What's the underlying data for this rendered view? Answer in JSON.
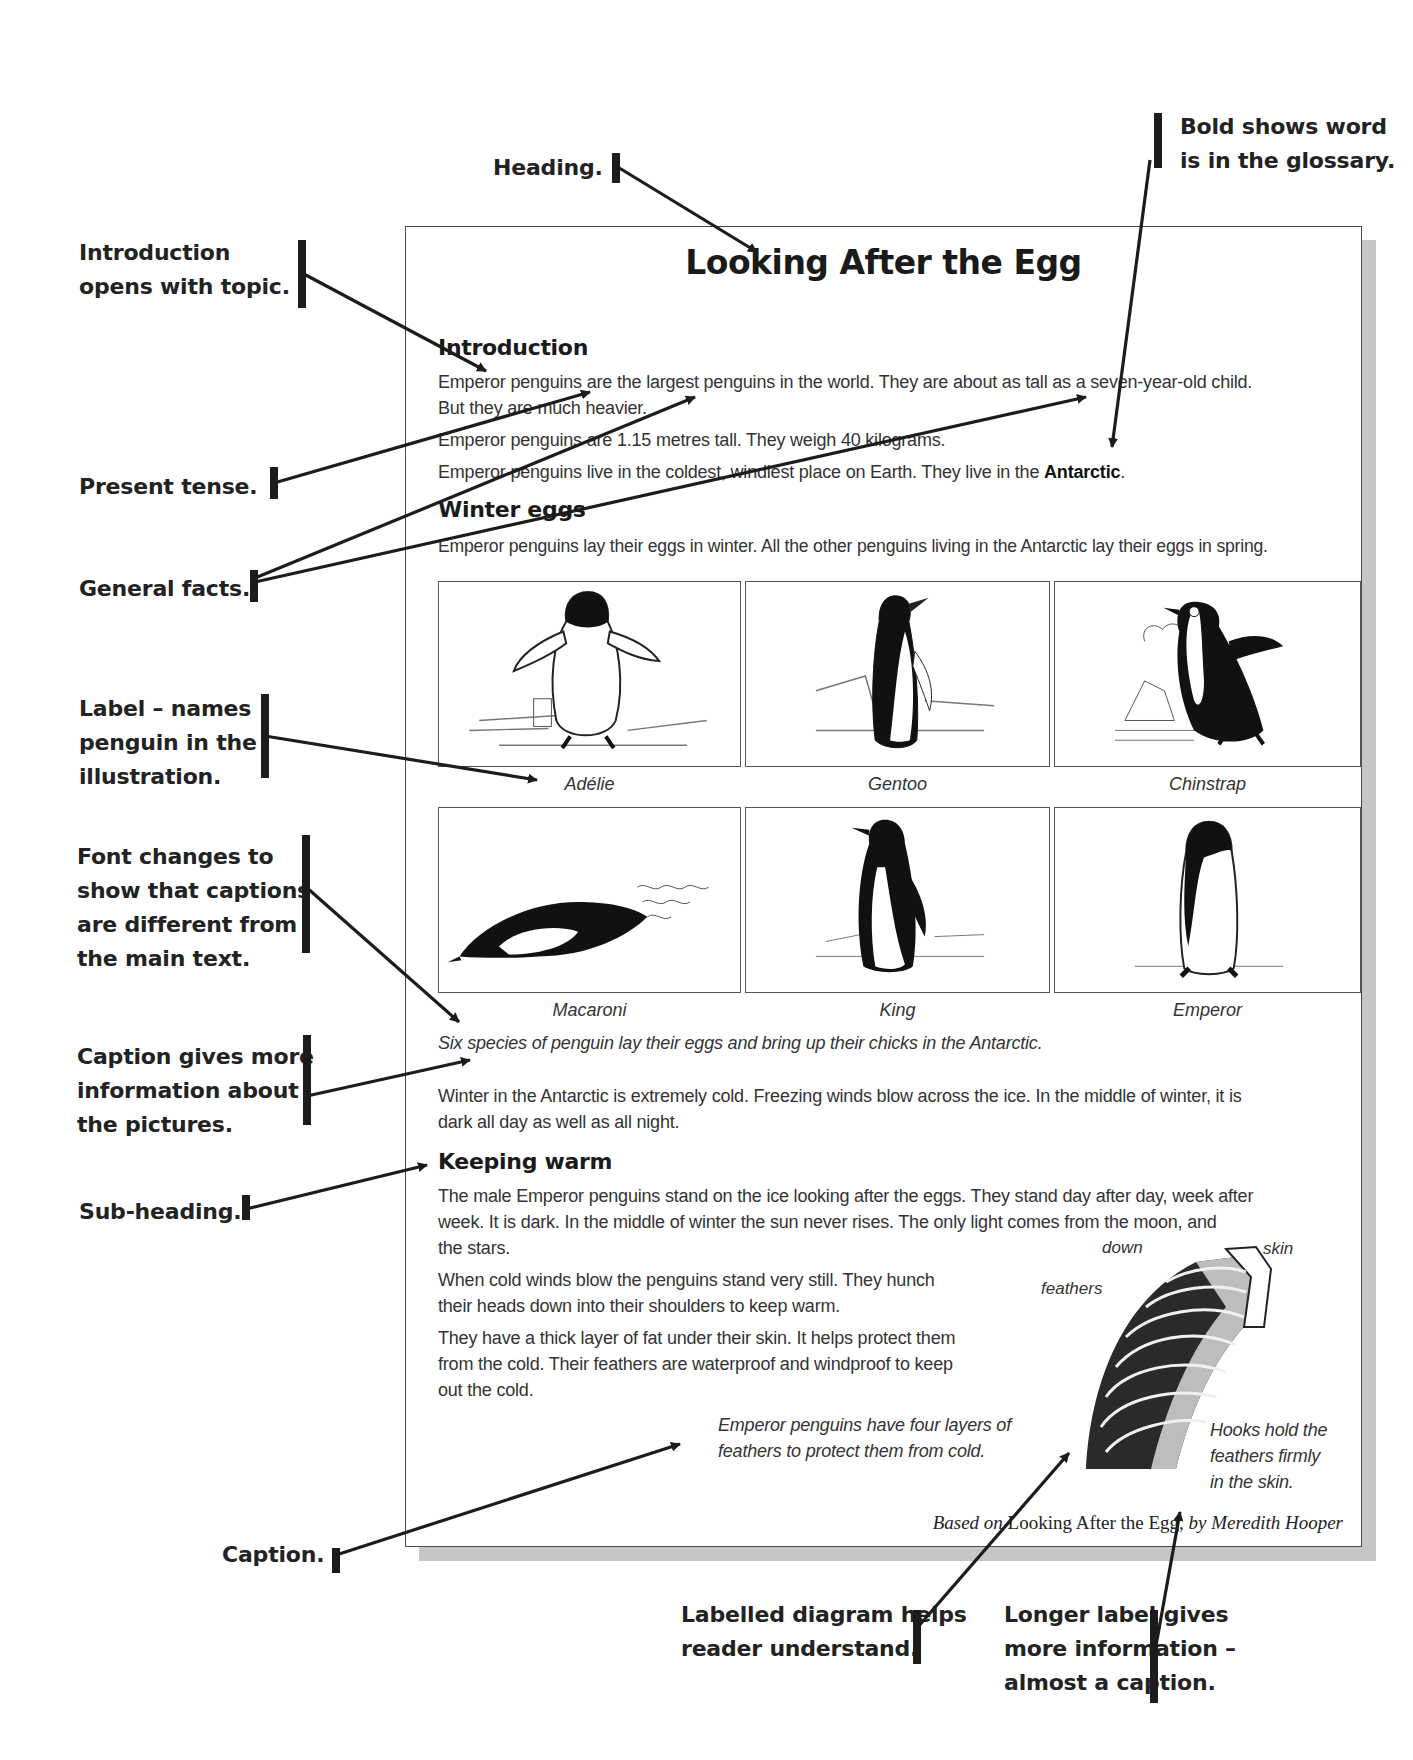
{
  "document": {
    "title": "Looking After the Egg",
    "sections": [
      {
        "heading": "Introduction",
        "paragraphs": [
          "Emperor penguins are the largest penguins in the world. They are about as tall as a seven-year-old child.",
          "But they are much heavier.",
          "Emperor penguins are 1.15 metres tall. They weigh 40 kilograms.",
          "Emperor penguins live in the coldest, windiest place on Earth. They live in the",
          "Antarctic",
          "."
        ]
      },
      {
        "heading": "Winter eggs",
        "paragraphs": [
          "Emperor penguins lay their eggs in winter. All the other penguins living in the Antarctic lay their eggs in spring."
        ]
      }
    ],
    "penguin_images": [
      {
        "label": "Adélie",
        "icon": "adelie-penguin-illustration"
      },
      {
        "label": "Gentoo",
        "icon": "gentoo-penguin-illustration"
      },
      {
        "label": "Chinstrap",
        "icon": "chinstrap-penguin-illustration"
      },
      {
        "label": "Macaroni",
        "icon": "macaroni-penguin-illustration"
      },
      {
        "label": "King",
        "icon": "king-penguin-illustration"
      },
      {
        "label": "Emperor",
        "icon": "emperor-penguin-illustration"
      }
    ],
    "figure_caption": "Six species of penguin lay their eggs and bring up their chicks in the Antarctic.",
    "winter_paragraph": [
      "Winter in the Antarctic is extremely cold. Freezing winds blow across the ice. In the middle of winter, it is",
      "dark all day as well as all night."
    ],
    "keeping_warm": {
      "heading": "Keeping warm",
      "paragraph1": [
        "The male Emperor penguins stand on the ice looking after the eggs. They stand day after day, week after",
        "week. It is dark. In the middle of winter the sun never rises. The only light comes from the moon, and",
        "the stars."
      ],
      "paragraph2": [
        "When cold winds blow the penguins stand very still. They hunch",
        "their heads down into their shoulders to keep warm."
      ],
      "paragraph3": [
        "They have a thick layer of fat under their skin. It helps protect them",
        "from the cold. Their feathers are waterproof and windproof to keep",
        "out the cold."
      ]
    },
    "diagram": {
      "caption": [
        "Emperor penguins have four layers of",
        "feathers to protect them from cold."
      ],
      "labels": {
        "down": "down",
        "skin": "skin",
        "feathers": "feathers",
        "hooks": [
          "Hooks hold the",
          "feathers firmly",
          "in the skin."
        ]
      }
    },
    "attribution": {
      "prefix": "Based on",
      "book": "Looking After the Egg,",
      "by": "by Meredith Hooper"
    }
  },
  "annotations": {
    "heading": "Heading.",
    "bold_glossary": [
      "Bold shows word",
      "is in the glossary."
    ],
    "introduction": [
      "Introduction",
      "opens with topic."
    ],
    "present_tense": "Present tense.",
    "general_facts": "General facts.",
    "label": [
      "Label – names",
      "penguin in the",
      "illustration."
    ],
    "font_changes": [
      "Font changes to",
      "show that captions",
      "are different from",
      "the main text."
    ],
    "caption_info": [
      "Caption gives more",
      "information about",
      "the pictures."
    ],
    "sub_heading": "Sub-heading.",
    "caption": "Caption.",
    "labelled_diagram": [
      "Labelled diagram helps",
      "reader understand."
    ],
    "longer_label": [
      "Longer label gives",
      "more information –",
      "almost a caption."
    ]
  },
  "colors": {
    "ink": "#1c1c1c",
    "body_text": "#333333",
    "page_border": "#4a4a4a",
    "page_shadow": "#c6c6c6"
  }
}
